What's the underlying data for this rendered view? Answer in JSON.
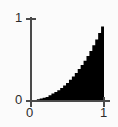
{
  "chart_data": {
    "type": "area",
    "title": "",
    "subtitle": "",
    "xlabel": "",
    "ylabel": "",
    "xlim": [
      0,
      1
    ],
    "ylim": [
      0,
      1
    ],
    "grid": false,
    "legend": null,
    "fill_color": "#000000",
    "axis_color": "#4a4a4a",
    "background_color": "#fbfbfb",
    "x_ticks": [
      {
        "value": 0,
        "label": "0"
      },
      {
        "value": 1,
        "label": "1"
      }
    ],
    "y_ticks": [
      {
        "value": 0,
        "label": "0"
      },
      {
        "value": 1,
        "label": "1"
      }
    ],
    "series": [
      {
        "name": "cumulative",
        "step": true,
        "x": [
          0.0,
          0.04,
          0.08,
          0.12,
          0.16,
          0.2,
          0.24,
          0.28,
          0.32,
          0.36,
          0.4,
          0.44,
          0.48,
          0.52,
          0.56,
          0.6,
          0.64,
          0.68,
          0.72,
          0.76,
          0.8,
          0.84,
          0.88,
          0.92,
          0.96,
          1.0
        ],
        "values": [
          0.0,
          0.01,
          0.02,
          0.03,
          0.04,
          0.05,
          0.07,
          0.09,
          0.11,
          0.13,
          0.16,
          0.19,
          0.22,
          0.26,
          0.3,
          0.34,
          0.39,
          0.44,
          0.49,
          0.55,
          0.61,
          0.68,
          0.75,
          0.83,
          0.91,
          1.0
        ]
      }
    ]
  }
}
